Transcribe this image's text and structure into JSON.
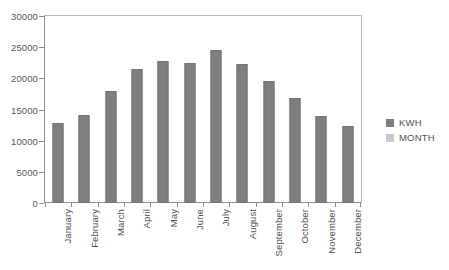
{
  "chart_data": {
    "type": "bar",
    "title": "",
    "xlabel": "",
    "ylabel": "",
    "categories": [
      "January",
      "February",
      "March",
      "April",
      "May",
      "June",
      "July",
      "August",
      "September",
      "October",
      "November",
      "December"
    ],
    "series": [
      {
        "name": "KWH",
        "color": "#7f7f7f",
        "values": [
          12900,
          14200,
          18000,
          21500,
          22800,
          22400,
          24500,
          22300,
          19600,
          16900,
          13900,
          12400
        ]
      }
    ],
    "ylim": [
      0,
      30000
    ],
    "yticks": [
      0,
      5000,
      10000,
      15000,
      20000,
      25000,
      30000
    ],
    "ytick_labels": [
      "0",
      "5000",
      "10000",
      "15000",
      "20000",
      "25000",
      "30000"
    ],
    "grid": false,
    "legend_position": "right",
    "legend": [
      {
        "label": "KWH",
        "color": "#7f7f7f"
      },
      {
        "label": "MONTH",
        "color": "#c8c8c8"
      }
    ]
  }
}
